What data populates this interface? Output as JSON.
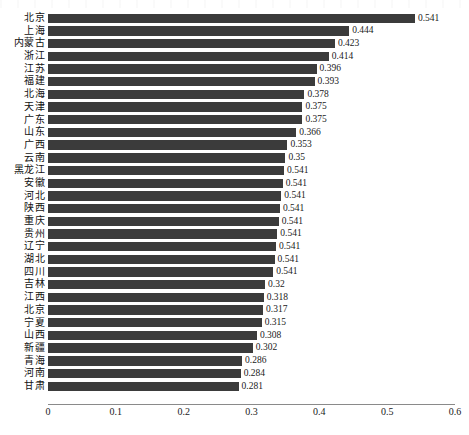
{
  "chart_data": {
    "type": "bar",
    "orientation": "horizontal",
    "title": "",
    "xlabel": "",
    "ylabel": "",
    "xlim": [
      0,
      0.6
    ],
    "xticks": [
      "0",
      "0.1",
      "0.2",
      "0.3",
      "0.4",
      "0.5",
      "0.6"
    ],
    "xtick_values": [
      0,
      0.1,
      0.2,
      0.3,
      0.4,
      0.5,
      0.6
    ],
    "grid": false,
    "legend": false,
    "bar_color": "#3b3b3b",
    "axis_color": "#8a8a8a",
    "categories": [
      "北京",
      "上海",
      "内蒙古",
      "浙江",
      "江苏",
      "福建",
      "北海",
      "天津",
      "广东",
      "山东",
      "广西",
      "云南",
      "黑龙江",
      "安徽",
      "河北",
      "陕西",
      "重庆",
      "贵州",
      "辽宁",
      "湖北",
      "四川",
      "吉林",
      "江西",
      "北京",
      "宁夏",
      "山西",
      "新疆",
      "青海",
      "河南",
      "甘肃"
    ],
    "values": [
      0.541,
      0.444,
      0.423,
      0.414,
      0.396,
      0.393,
      0.378,
      0.375,
      0.375,
      0.366,
      0.353,
      0.35,
      0.348,
      0.346,
      0.344,
      0.342,
      0.34,
      0.338,
      0.336,
      0.334,
      0.332,
      0.32,
      0.318,
      0.317,
      0.315,
      0.308,
      0.302,
      0.286,
      0.284,
      0.281
    ],
    "data_labels": [
      "0.541",
      "0.444",
      "0.423",
      "0.414",
      "0.396",
      "0.393",
      "0.378",
      "0.375",
      "0.375",
      "0.366",
      "0.353",
      "0.35",
      "0.541",
      "0.541",
      "0.541",
      "0.541",
      "0.541",
      "0.541",
      "0.541",
      "0.541",
      "0.541",
      "0.32",
      "0.318",
      "0.317",
      "0.315",
      "0.308",
      "0.302",
      "0.286",
      "0.284",
      "0.281"
    ]
  }
}
